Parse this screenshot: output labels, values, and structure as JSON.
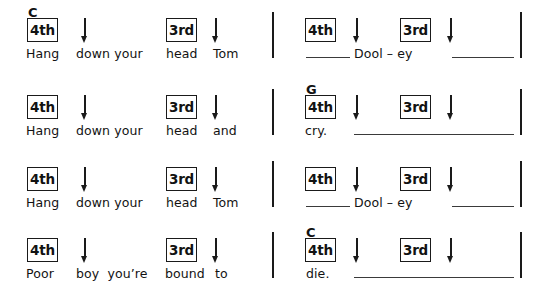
{
  "document": {
    "kind": "guitar-strum-pattern-chart",
    "song_lyrics_title": "Tom Dooley"
  },
  "rows": [
    {
      "id": "row-1",
      "left": {
        "chord": "C",
        "boxes": [
          {
            "label": "4th",
            "x": 27
          },
          {
            "label": "3rd",
            "x": 166
          }
        ],
        "arrows": [
          {
            "x": 80
          },
          {
            "x": 211
          }
        ],
        "lyrics": [
          {
            "text": "Hang",
            "x": 26
          },
          {
            "text": "down your",
            "x": 76
          },
          {
            "text": "head",
            "x": 166
          },
          {
            "text": "Tom",
            "x": 213
          }
        ],
        "holdlines": []
      },
      "right": {
        "chord": "",
        "boxes": [
          {
            "label": "4th",
            "x": 305
          },
          {
            "label": "3rd",
            "x": 400
          }
        ],
        "arrows": [
          {
            "x": 352
          },
          {
            "x": 446
          }
        ],
        "lyrics": [
          {
            "text": "Dool – ey",
            "x": 354
          }
        ],
        "holdlines": [
          {
            "x": 306,
            "w": 44
          },
          {
            "x": 452,
            "w": 62
          }
        ]
      }
    },
    {
      "id": "row-2",
      "left": {
        "chord": "",
        "boxes": [
          {
            "label": "4th",
            "x": 27
          },
          {
            "label": "3rd",
            "x": 166
          }
        ],
        "arrows": [
          {
            "x": 80
          },
          {
            "x": 211
          }
        ],
        "lyrics": [
          {
            "text": "Hang",
            "x": 26
          },
          {
            "text": "down your",
            "x": 76
          },
          {
            "text": "head",
            "x": 166
          },
          {
            "text": "and",
            "x": 213
          }
        ],
        "holdlines": []
      },
      "right": {
        "chord": "G",
        "boxes": [
          {
            "label": "4th",
            "x": 305
          },
          {
            "label": "3rd",
            "x": 400
          }
        ],
        "arrows": [
          {
            "x": 352
          },
          {
            "x": 446
          }
        ],
        "lyrics": [
          {
            "text": "cry.",
            "x": 305
          }
        ],
        "holdlines": [
          {
            "x": 354,
            "w": 160
          }
        ]
      }
    },
    {
      "id": "row-3",
      "left": {
        "chord": "",
        "boxes": [
          {
            "label": "4th",
            "x": 27
          },
          {
            "label": "3rd",
            "x": 166
          }
        ],
        "arrows": [
          {
            "x": 80
          },
          {
            "x": 211
          }
        ],
        "lyrics": [
          {
            "text": "Hang",
            "x": 26
          },
          {
            "text": "down your",
            "x": 76
          },
          {
            "text": "head",
            "x": 166
          },
          {
            "text": "Tom",
            "x": 213
          }
        ],
        "holdlines": []
      },
      "right": {
        "chord": "",
        "boxes": [
          {
            "label": "4th",
            "x": 305
          },
          {
            "label": "3rd",
            "x": 400
          }
        ],
        "arrows": [
          {
            "x": 352
          },
          {
            "x": 446
          }
        ],
        "lyrics": [
          {
            "text": "Dool – ey",
            "x": 354
          }
        ],
        "holdlines": [
          {
            "x": 306,
            "w": 44
          },
          {
            "x": 452,
            "w": 62
          }
        ]
      }
    },
    {
      "id": "row-4",
      "left": {
        "chord": "",
        "boxes": [
          {
            "label": "4th",
            "x": 27
          },
          {
            "label": "3rd",
            "x": 166
          }
        ],
        "arrows": [
          {
            "x": 80
          },
          {
            "x": 211
          }
        ],
        "lyrics": [
          {
            "text": "Poor",
            "x": 26
          },
          {
            "text": "boy  you’re",
            "x": 76
          },
          {
            "text": "bound",
            "x": 165
          },
          {
            "text": "to",
            "x": 215
          }
        ],
        "holdlines": []
      },
      "right": {
        "chord": "C",
        "boxes": [
          {
            "label": "4th",
            "x": 305
          },
          {
            "label": "3rd",
            "x": 400
          }
        ],
        "arrows": [
          {
            "x": 352
          },
          {
            "x": 446
          }
        ],
        "lyrics": [
          {
            "text": "die.",
            "x": 306
          }
        ],
        "holdlines": [
          {
            "x": 354,
            "w": 160
          }
        ]
      }
    }
  ],
  "barlines": [
    {
      "x": 272,
      "rows": [
        0,
        1,
        2,
        3
      ]
    },
    {
      "x": 520,
      "rows": [
        0,
        1,
        2,
        3
      ]
    }
  ],
  "geometry": {
    "row_tops": [
      6,
      83,
      155,
      226
    ],
    "box_top": 12,
    "chord_top": 0,
    "arrow_top": 12,
    "lyric_top": 41,
    "holdline_top": 51,
    "barline_top": 6,
    "barline_height": 46
  },
  "colors": {
    "ink": "#1a1a1a",
    "paper": "#ffffff",
    "rule": "#3a3a3a"
  }
}
